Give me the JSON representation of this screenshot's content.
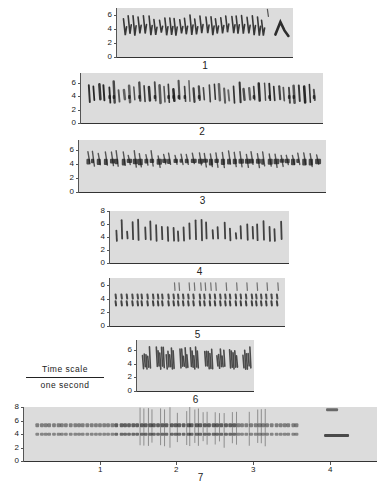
{
  "figure": {
    "y_axis_unit": "kHz",
    "time_scale": {
      "label": "Time scale",
      "sublabel": "one second"
    },
    "panels": [
      {
        "id": "1",
        "label": "1",
        "x": 117,
        "y": 8,
        "w": 176,
        "h": 49,
        "yticks": [
          "0",
          "2",
          "4",
          "6"
        ],
        "ymax": 7,
        "notes": 28,
        "band": [
          3,
          6
        ],
        "style": "sweep",
        "tail": "loop"
      },
      {
        "id": "2",
        "label": "2",
        "x": 81,
        "y": 73,
        "w": 242,
        "h": 50,
        "yticks": [
          "0",
          "2",
          "4",
          "6"
        ],
        "ymax": 7.5,
        "notes": 46,
        "band": [
          3,
          6.5
        ],
        "style": "mixed"
      },
      {
        "id": "3",
        "label": "3",
        "x": 79,
        "y": 140,
        "w": 247,
        "h": 52,
        "yticks": [
          "0",
          "2",
          "4",
          "6"
        ],
        "ymax": 7.5,
        "notes": 40,
        "band": [
          3,
          6.5
        ],
        "style": "blob"
      },
      {
        "id": "4",
        "label": "4",
        "x": 110,
        "y": 211,
        "w": 179,
        "h": 52,
        "yticks": [
          "0",
          "2",
          "4",
          "6",
          "8"
        ],
        "ymax": 8,
        "notes": 30,
        "band": [
          3.5,
          6.5
        ],
        "style": "vertical"
      },
      {
        "id": "5",
        "label": "5",
        "x": 110,
        "y": 278,
        "w": 175,
        "h": 48,
        "yticks": [
          "0",
          "2",
          "4",
          "6"
        ],
        "ymax": 7,
        "notes": 32,
        "band": [
          3,
          6
        ],
        "style": "double"
      },
      {
        "id": "6",
        "label": "6",
        "x": 137,
        "y": 340,
        "w": 117,
        "h": 51,
        "yticks": [
          "0",
          "2",
          "4",
          "6"
        ],
        "ymax": 7.5,
        "notes": 9,
        "band": [
          3,
          6.5
        ],
        "style": "dense"
      },
      {
        "id": "7",
        "label": "7",
        "x": 24,
        "y": 407,
        "w": 353,
        "h": 54,
        "yticks": [
          "0",
          "2",
          "4",
          "6",
          "8"
        ],
        "ymax": 8,
        "notes": 80,
        "band": [
          3.5,
          6
        ],
        "style": "trill",
        "xticks": [
          {
            "label": "1",
            "x": 76
          },
          {
            "label": "2",
            "x": 152
          },
          {
            "label": "3",
            "x": 229
          },
          {
            "label": "4",
            "x": 306
          }
        ]
      }
    ]
  },
  "colors": {
    "background": "#ffffff",
    "plot_fill": "#dcdcdc",
    "ink": "#1a1a1a",
    "axis": "#444444"
  }
}
